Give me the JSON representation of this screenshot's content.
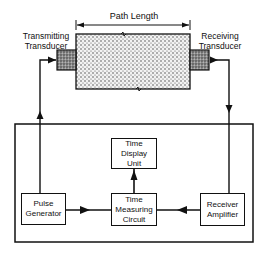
{
  "diagram": {
    "path_length_label": "Path Length",
    "transmitting_transducer": {
      "line1": "Transmitting",
      "line2": "Transducer"
    },
    "receiving_transducer": {
      "line1": "Receiving",
      "line2": "Transducer"
    },
    "blocks": {
      "time_display_unit": {
        "line1": "Time",
        "line2": "Display",
        "line3": "Unit"
      },
      "pulse_generator": {
        "line1": "Pulse",
        "line2": "Generator"
      },
      "time_measuring_circuit": {
        "line1": "Time",
        "line2": "Measuring",
        "line3": "Circuit"
      },
      "receiver_amplifier": {
        "line1": "Receiver",
        "line2": "Amplifier"
      }
    },
    "colors": {
      "line": "#111111",
      "specimen_fill": "#d9d9d9",
      "transducer_fill": "#9a9a9a"
    }
  }
}
